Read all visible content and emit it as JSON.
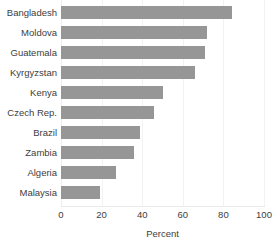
{
  "chart_data": {
    "type": "bar",
    "orientation": "horizontal",
    "title": "",
    "xlabel": "Percent",
    "ylabel": "",
    "categories": [
      "Bangladesh",
      "Moldova",
      "Guatemala",
      "Kyrgyzstan",
      "Kenya",
      "Czech Rep.",
      "Brazil",
      "Zambia",
      "Algeria",
      "Malaysia"
    ],
    "values": [
      84,
      72,
      71,
      66,
      50,
      46,
      39,
      36,
      27,
      19
    ],
    "xlim": [
      0,
      100
    ],
    "xticks": [
      0,
      20,
      40,
      60,
      80,
      100
    ],
    "xtick_labels": [
      "0",
      "20",
      "40",
      "60",
      "80",
      "100"
    ],
    "grid": true,
    "legend": false,
    "bar_color": "#969696",
    "gridline_color": "#f2f2f2",
    "text_color": "#3d3d3d"
  }
}
